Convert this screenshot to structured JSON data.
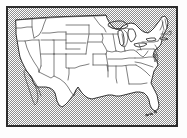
{
  "figure": {
    "kind": "reference-map",
    "frame": {
      "border_color": "#2b2b2b",
      "background_color": "#ffffff",
      "margin_color": "#ffffff"
    },
    "palette": {
      "land_fill": "#ffffff",
      "coastline": "#1f1f1f",
      "state_border": "#3a3a3a",
      "water_dither": "#8d8d8d",
      "plate_border": "#2b2b2b"
    },
    "legend": {
      "land_label": "United States (white)",
      "water_label": "Water and foreign land (stippled)"
    }
  },
  "map": {
    "region_name": "Contiguous United States",
    "projection_note": "conic",
    "features": {
      "great_lakes": [
        "Lake Superior",
        "Lake Michigan",
        "Lake Huron",
        "Lake Erie",
        "Lake Ontario"
      ],
      "peninsulas": [
        "Florida",
        "Baja California",
        "Cape Cod",
        "Delmarva"
      ],
      "islands": [
        "Florida Keys",
        "Long Island"
      ],
      "neighbors": [
        "Canada",
        "Mexico"
      ],
      "oceans": [
        "Pacific Ocean",
        "Atlantic Ocean",
        "Gulf of Mexico"
      ]
    },
    "state_count": 48,
    "states": [
      "Washington",
      "Oregon",
      "California",
      "Nevada",
      "Idaho",
      "Montana",
      "Wyoming",
      "Utah",
      "Arizona",
      "Colorado",
      "New Mexico",
      "North Dakota",
      "South Dakota",
      "Nebraska",
      "Kansas",
      "Oklahoma",
      "Texas",
      "Minnesota",
      "Iowa",
      "Missouri",
      "Arkansas",
      "Louisiana",
      "Wisconsin",
      "Illinois",
      "Michigan",
      "Indiana",
      "Ohio",
      "Kentucky",
      "Tennessee",
      "Mississippi",
      "Alabama",
      "Georgia",
      "Florida",
      "South Carolina",
      "North Carolina",
      "Virginia",
      "West Virginia",
      "Maryland",
      "Delaware",
      "Pennsylvania",
      "New Jersey",
      "New York",
      "Connecticut",
      "Rhode Island",
      "Massachusetts",
      "Vermont",
      "New Hampshire",
      "Maine"
    ]
  }
}
